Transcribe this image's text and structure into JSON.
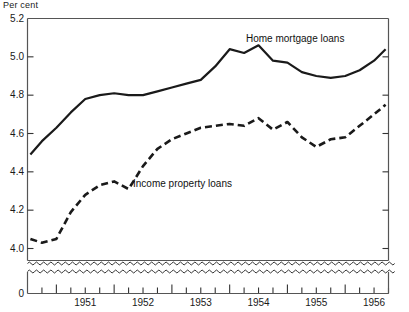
{
  "chart_data": {
    "type": "line",
    "title": "",
    "ylabel": "Per cent",
    "xlabel": "",
    "ylim": [
      3.9,
      5.2
    ],
    "y_axis_break": true,
    "y_break_baseline_label": "0",
    "grid": false,
    "legend_position": "inline-annotation",
    "yticks": [
      "5.2",
      "5.0",
      "4.8",
      "4.6",
      "4.4",
      "4.2",
      "4.0"
    ],
    "ytick_values": [
      5.2,
      5.0,
      4.8,
      4.6,
      4.4,
      4.2,
      4.0
    ],
    "xticks": [
      "1951",
      "1952",
      "1953",
      "1954",
      "1955",
      "1956"
    ],
    "xtick_values": [
      1951,
      1952,
      1953,
      1954,
      1955,
      1956
    ],
    "x_minor_interval": "quarterly",
    "xlim": [
      1950.5,
      1956.75
    ],
    "series": [
      {
        "name": "Home mortgage loans",
        "style": "solid",
        "color": "#1a1a1a",
        "x": [
          1950.55,
          1950.75,
          1951.0,
          1951.25,
          1951.5,
          1951.75,
          1952.0,
          1952.25,
          1952.5,
          1952.75,
          1953.0,
          1953.25,
          1953.5,
          1953.75,
          1954.0,
          1954.25,
          1954.5,
          1954.75,
          1955.0,
          1955.25,
          1955.5,
          1955.75,
          1956.0,
          1956.25,
          1956.5,
          1956.7
        ],
        "values": [
          4.49,
          4.56,
          4.63,
          4.71,
          4.78,
          4.8,
          4.81,
          4.8,
          4.8,
          4.82,
          4.84,
          4.86,
          4.88,
          4.95,
          5.04,
          5.02,
          5.06,
          4.98,
          4.97,
          4.92,
          4.9,
          4.89,
          4.9,
          4.93,
          4.98,
          5.04
        ]
      },
      {
        "name": "Income property loans",
        "style": "dashed",
        "color": "#1a1a1a",
        "x": [
          1950.55,
          1950.75,
          1951.0,
          1951.25,
          1951.5,
          1951.75,
          1952.0,
          1952.25,
          1952.5,
          1952.75,
          1953.0,
          1953.25,
          1953.5,
          1953.75,
          1954.0,
          1954.25,
          1954.5,
          1954.75,
          1955.0,
          1955.25,
          1955.5,
          1955.75,
          1956.0,
          1956.25,
          1956.5,
          1956.7
        ],
        "values": [
          4.05,
          4.03,
          4.05,
          4.19,
          4.28,
          4.33,
          4.35,
          4.31,
          4.43,
          4.52,
          4.57,
          4.6,
          4.63,
          4.64,
          4.65,
          4.64,
          4.68,
          4.62,
          4.66,
          4.58,
          4.53,
          4.57,
          4.58,
          4.64,
          4.7,
          4.75
        ]
      }
    ],
    "annotations": [
      {
        "text": "Home mortgage loans",
        "x_px": 246,
        "y_px": 33
      },
      {
        "text": "Income property loans",
        "x_px": 133,
        "y_px": 178
      }
    ]
  },
  "axis": {
    "unit_label": "Per cent",
    "zero_label": "0"
  }
}
